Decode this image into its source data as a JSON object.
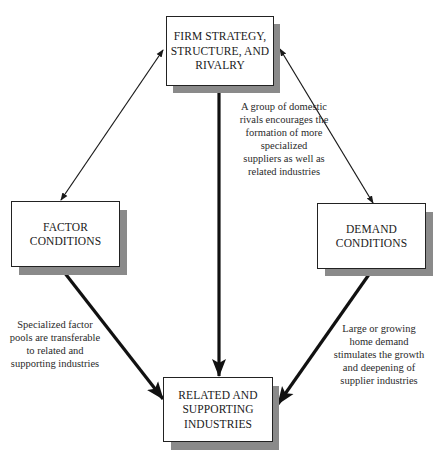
{
  "diagram": {
    "type": "porter-diamond",
    "nodes": {
      "firm": {
        "label": "FIRM STRATEGY,\nSTRUCTURE, AND\nRIVALRY"
      },
      "factor": {
        "label": "FACTOR\nCONDITIONS"
      },
      "demand": {
        "label": "DEMAND\nCONDITIONS"
      },
      "related": {
        "label": "RELATED AND\nSUPPORTING\nINDUSTRIES"
      }
    },
    "edges": [
      {
        "from": "firm",
        "to": "factor",
        "style": "thin-double-arrow"
      },
      {
        "from": "firm",
        "to": "demand",
        "style": "thin-double-arrow"
      },
      {
        "from": "firm",
        "to": "related",
        "style": "thick-arrow",
        "note": "A group of domestic\nrivals encourages the\nformation of more\nspecialized\nsuppliers  as well as\nrelated industries"
      },
      {
        "from": "factor",
        "to": "related",
        "style": "thick-arrow",
        "note": "Specialized factor\npools are transferable\nto related and\nsupporting industries"
      },
      {
        "from": "demand",
        "to": "related",
        "style": "thick-arrow",
        "note": "Large or growing\nhome demand\nstimulates the growth\nand deepening of\nsupplier industries"
      }
    ],
    "notes": {
      "firm_to_related": "A group of domestic\nrivals encourages the\nformation of more\nspecialized\nsuppliers  as well as\nrelated industries",
      "factor_to_related": "Specialized factor\npools are transferable\nto related and\nsupporting industries",
      "demand_to_related": "Large or growing\nhome demand\nstimulates the growth\nand deepening of\nsupplier industries"
    },
    "colors": {
      "line": "#1a1a1a",
      "shadow": "#8a8a8a",
      "box_fill": "#ffffff"
    }
  }
}
